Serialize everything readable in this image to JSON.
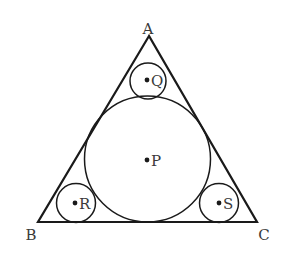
{
  "diagram": {
    "type": "geometry",
    "stroke_color": "#1a1a1a",
    "label_color": "#3a3a3a",
    "triangle": {
      "vertices": {
        "A": {
          "label": "A",
          "x": 149,
          "y": 36,
          "label_x": 148,
          "label_y": 34
        },
        "B": {
          "label": "B",
          "x": 38,
          "y": 222,
          "label_x": 31,
          "label_y": 240
        },
        "C": {
          "label": "C",
          "x": 257,
          "y": 222,
          "label_x": 264,
          "label_y": 240
        }
      }
    },
    "circles": [
      {
        "name": "P",
        "label": "P",
        "cx": 147.5,
        "cy": 159,
        "r": 63,
        "dot_x": 147,
        "dot_y": 160,
        "label_x": 151,
        "label_y": 166
      },
      {
        "name": "Q",
        "label": "Q",
        "cx": 148,
        "cy": 81,
        "r": 18,
        "dot_x": 147,
        "dot_y": 80,
        "label_x": 151,
        "label_y": 86
      },
      {
        "name": "R",
        "label": "R",
        "cx": 76,
        "cy": 203,
        "r": 19.5,
        "dot_x": 75,
        "dot_y": 203,
        "label_x": 79,
        "label_y": 209
      },
      {
        "name": "S",
        "label": "S",
        "cx": 219,
        "cy": 203,
        "r": 19.5,
        "dot_x": 219,
        "dot_y": 203,
        "label_x": 223,
        "label_y": 209
      }
    ]
  }
}
